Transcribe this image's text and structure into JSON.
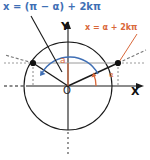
{
  "diagram": {
    "axes": {
      "x_label": "X",
      "y_label": "Y",
      "origin_label": "O"
    },
    "labels": {
      "supplementary_solution": "x = (π − α) + 2kπ",
      "principal_solution": "x = α + 2kπ",
      "value_label": "a",
      "angle_label": "α"
    },
    "colors": {
      "blue": "#3f6fb5",
      "orange": "#d9683a",
      "black": "#1a1a1a",
      "gray": "#808080",
      "background": "#ffffff"
    },
    "geometry": {
      "center": [
        68,
        86
      ],
      "radius": 44,
      "chord_y": 63,
      "point_right": [
        118,
        63
      ],
      "point_left": [
        33,
        63
      ]
    }
  }
}
